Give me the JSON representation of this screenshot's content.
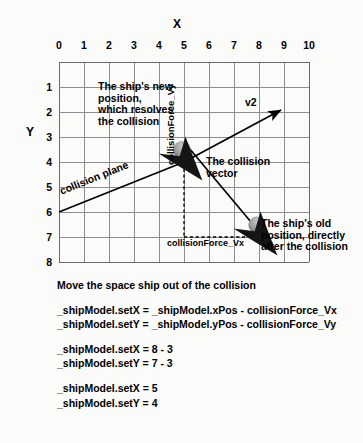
{
  "axes": {
    "x_title": "X",
    "y_title": "Y",
    "x_ticks": [
      "0",
      "1",
      "2",
      "3",
      "4",
      "5",
      "6",
      "7",
      "8",
      "9",
      "10"
    ],
    "y_ticks": [
      "1",
      "2",
      "3",
      "4",
      "5",
      "6",
      "7",
      "8"
    ]
  },
  "annotations": {
    "new_position": "The ship's new position, which resolves the collision",
    "collision_vector": "The collision vector",
    "old_position": "The ship's old position, directly after the collision",
    "v2": "v2",
    "collision_plane": "collision plane",
    "collision_force_vy": "collisionForce_Vy",
    "collision_force_vx": "collisionForce_Vx"
  },
  "code": {
    "heading": "Move the space ship out of the collision",
    "line1": "_shipModel.setX = _shipModel.xPos - collisionForce_Vx",
    "line2": "_shipModel.setY = _shipModel.yPos - collisionForce_Vy",
    "line3": "_shipModel.setX = 8 - 3",
    "line4": "_shipModel.setY = 7 - 3",
    "line5": "_shipModel.setX = 5",
    "line6": "_shipModel.setY = 4"
  },
  "chart_data": {
    "type": "diagram",
    "xlabel": "X",
    "ylabel": "Y",
    "xlim": [
      0,
      10
    ],
    "ylim": [
      0,
      8
    ],
    "grid": true,
    "xticks": [
      0,
      1,
      2,
      3,
      4,
      5,
      6,
      7,
      8,
      9,
      10
    ],
    "yticks": [
      1,
      2,
      3,
      4,
      5,
      6,
      7,
      8
    ],
    "ships": [
      {
        "name": "new-position-ship",
        "x": 5,
        "y": 4,
        "heading_deg": 135
      },
      {
        "name": "old-position-ship",
        "x": 8,
        "y": 7,
        "heading_deg": 135
      }
    ],
    "vectors": [
      {
        "name": "v2",
        "from": [
          0,
          6
        ],
        "to": [
          9,
          2
        ],
        "arrow": true,
        "label": "v2"
      },
      {
        "name": "collision-vector",
        "from": [
          5,
          4
        ],
        "to": [
          8,
          7
        ],
        "arrow": true,
        "label": "The collision vector"
      }
    ],
    "lines": [
      {
        "name": "collision-plane",
        "from": [
          0,
          6
        ],
        "to": [
          5,
          4
        ],
        "label": "collision plane",
        "style": "solid"
      }
    ],
    "dashed": [
      {
        "name": "collisionForce_Vy",
        "from": [
          5,
          4
        ],
        "to": [
          5,
          7
        ],
        "label": "collisionForce_Vy",
        "magnitude": 3
      },
      {
        "name": "collisionForce_Vx",
        "from": [
          5,
          7
        ],
        "to": [
          8,
          7
        ],
        "label": "collisionForce_Vx",
        "magnitude": 3
      }
    ]
  },
  "colors": {
    "grid": "#8d8d8d",
    "ink": "#000000",
    "ship_body": "#1a1a1a",
    "ship_dome": "#9a9a9a",
    "background": "#fbfbfa"
  }
}
